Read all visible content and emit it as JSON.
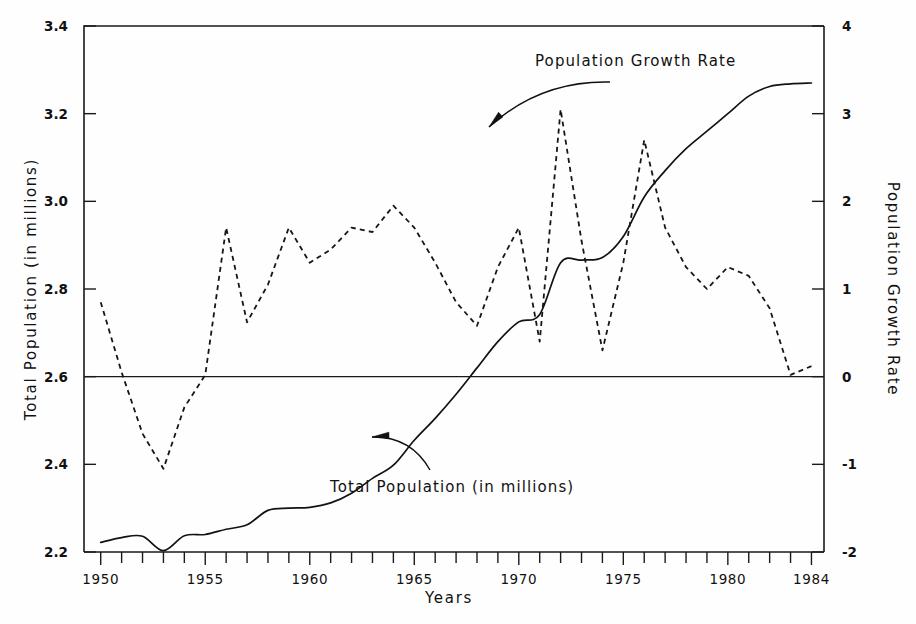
{
  "chart_data": {
    "type": "line",
    "title": "",
    "xlabel": "Years",
    "ylabel": "Total Population (in millions)",
    "ylabel_right": "Population Growth Rate",
    "grid": false,
    "legend_position": "inline-annotations",
    "xlim": [
      1949.2,
      1984.6
    ],
    "ylim_left": [
      2.2,
      3.4
    ],
    "ylim_right": [
      -2,
      4
    ],
    "x_tick_labels": [
      "1950",
      "1955",
      "1960",
      "1965",
      "1970",
      "1975",
      "1980",
      "1984"
    ],
    "x_tick_label_years": [
      1950,
      1955,
      1960,
      1965,
      1970,
      1975,
      1980,
      1984
    ],
    "x_minor_tick_years": [
      1950,
      1951,
      1952,
      1953,
      1954,
      1955,
      1956,
      1957,
      1958,
      1959,
      1960,
      1961,
      1962,
      1963,
      1964,
      1965,
      1966,
      1967,
      1968,
      1969,
      1970,
      1971,
      1972,
      1973,
      1974,
      1975,
      1976,
      1977,
      1978,
      1979,
      1980,
      1981,
      1982,
      1983,
      1984
    ],
    "y_left_ticks": [
      2.2,
      2.4,
      2.6,
      2.8,
      3.0,
      3.2,
      3.4
    ],
    "y_left_tick_labels": [
      "2.2",
      "2.4",
      "2.6",
      "2.8",
      "3.0",
      "3.2",
      "3.4"
    ],
    "y_right_ticks": [
      -2,
      -1,
      0,
      1,
      2,
      3,
      4
    ],
    "y_right_tick_labels": [
      "-2",
      "-1",
      "0",
      "1",
      "2",
      "3",
      "4"
    ],
    "zero_reference_line": 0,
    "x": [
      1950,
      1951,
      1952,
      1953,
      1954,
      1955,
      1956,
      1957,
      1958,
      1959,
      1960,
      1961,
      1962,
      1963,
      1964,
      1965,
      1966,
      1967,
      1968,
      1969,
      1970,
      1971,
      1972,
      1973,
      1974,
      1975,
      1976,
      1977,
      1978,
      1979,
      1980,
      1981,
      1982,
      1983,
      1984
    ],
    "series": [
      {
        "name": "Total Population (in millions)",
        "axis": "left",
        "style": "solid",
        "units": "millions",
        "values": [
          2.222,
          2.233,
          2.236,
          2.203,
          2.237,
          2.24,
          2.252,
          2.262,
          2.295,
          2.3,
          2.302,
          2.312,
          2.334,
          2.368,
          2.398,
          2.455,
          2.505,
          2.56,
          2.62,
          2.68,
          2.725,
          2.742,
          2.86,
          2.866,
          2.872,
          2.92,
          3.01,
          3.07,
          3.12,
          3.16,
          3.2,
          3.24,
          3.262,
          3.268,
          3.27
        ]
      },
      {
        "name": "Population Growth Rate",
        "axis": "right",
        "style": "dashed",
        "units": "percent",
        "values": [
          0.85,
          0.05,
          -0.65,
          -1.05,
          -0.35,
          0.02,
          1.7,
          0.62,
          1.05,
          1.7,
          1.3,
          1.45,
          1.7,
          1.65,
          1.95,
          1.7,
          1.3,
          0.85,
          0.58,
          1.25,
          1.7,
          0.4,
          3.05,
          1.55,
          0.3,
          1.3,
          2.7,
          1.7,
          1.25,
          1.0,
          1.25,
          1.15,
          0.78,
          0.02,
          0.12
        ]
      }
    ],
    "annotations": [
      {
        "label": "Population Growth Rate",
        "label_x_px": 535,
        "label_y_px": 66,
        "arrow_from_px": [
          610,
          82
        ],
        "arrow_to_px": [
          489,
          127
        ]
      },
      {
        "label": "Total Population (in millions)",
        "label_x_px": 330,
        "label_y_px": 492,
        "arrow_from_px": [
          430,
          470
        ],
        "arrow_to_px": [
          372,
          437
        ]
      }
    ]
  },
  "axes": {
    "left_title": "Total Population (in millions)",
    "right_title": "Population Growth Rate",
    "bottom_title": "Years"
  },
  "colors": {
    "background": "#fefefe",
    "axis": "#1a1a1a",
    "series_population": "#121212",
    "series_growth": "#161616",
    "text": "#111111"
  }
}
